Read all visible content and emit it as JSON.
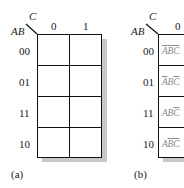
{
  "map_a": {
    "column_variable": "C",
    "row_variable": "AB",
    "column_headers": [
      "0",
      "1"
    ],
    "row_headers": [
      "00",
      "01",
      "11",
      "10"
    ],
    "cells": [
      [
        "",
        ""
      ],
      [
        "",
        ""
      ],
      [
        "",
        ""
      ],
      [
        "",
        ""
      ]
    ],
    "caption": "(a)"
  },
  "map_b": {
    "column_variable": "C",
    "row_variable": "AB",
    "column_headers": [
      "0"
    ],
    "row_headers": [
      "00",
      "01",
      "11",
      "10"
    ],
    "cells": [
      [
        {
          "A": "A",
          "A_bar": true,
          "B": "B",
          "B_bar": true,
          "C": "C",
          "C_bar": true
        }
      ],
      [
        {
          "A": "A",
          "A_bar": true,
          "B": "B",
          "B_bar": false,
          "C": "C",
          "C_bar": true
        }
      ],
      [
        {
          "A": "A",
          "A_bar": false,
          "B": "B",
          "B_bar": false,
          "C": "C",
          "C_bar": true
        }
      ],
      [
        {
          "A": "A",
          "A_bar": false,
          "B": "B",
          "B_bar": true,
          "C": "C",
          "C_bar": true
        }
      ]
    ],
    "cell_text_plain": [
      "ĀB̄C̄",
      "ĀBC̄",
      "ABC̄",
      "AB̄C̄"
    ],
    "caption": "(b)"
  },
  "colors": {
    "grid_line": "#111111",
    "shadow": "#c8c8c8",
    "term_text": "#8a8a8a"
  }
}
